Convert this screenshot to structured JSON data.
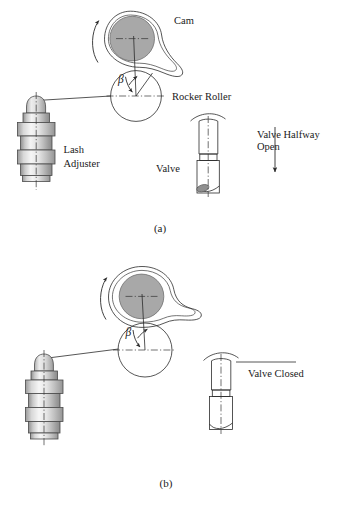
{
  "figure": {
    "title_present": false,
    "panels": [
      {
        "id": "panel-a",
        "caption": "(a)",
        "labels": {
          "cam": "Cam",
          "rocker_roller": "Rocker Roller",
          "lash_adjuster_line1": "Lash",
          "lash_adjuster_line2": "Adjuster",
          "valve": "Valve",
          "valve_state_line1": "Valve Halfway",
          "valve_state_line2": "Open",
          "angle_symbol": "β"
        }
      },
      {
        "id": "panel-b",
        "caption": "(b)",
        "labels": {
          "valve_state": "Valve Closed",
          "angle_symbol": "β"
        }
      }
    ],
    "colors": {
      "background": "#ffffff",
      "line": "#2b2b2b",
      "cam_base_circle_fill": "#a8a8a8",
      "metal_light": "#f2f2f2",
      "metal_mid": "#d6d6d6",
      "metal_dark": "#9a9a9a",
      "valve_tip_fill": "#8f8f8f"
    },
    "icons": {
      "rotation": "curved-rotation-arrow-icon",
      "motion": "down-arrow-icon"
    }
  }
}
